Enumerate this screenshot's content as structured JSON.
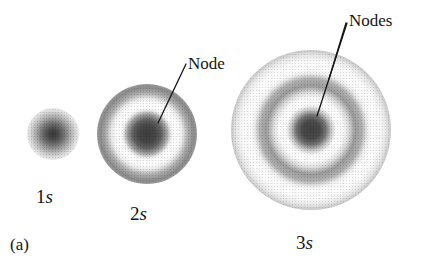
{
  "figure": {
    "panel_label": "(a)",
    "background_color": "#ffffff",
    "ink_color": "#141414",
    "width": 421,
    "height": 264
  },
  "orbitals": [
    {
      "id": "1s",
      "label_number": "1",
      "label_symbol": "s",
      "center_x": 53,
      "center_y": 134,
      "radius": 26,
      "node_count": 0,
      "label_x": 36,
      "label_y": 187
    },
    {
      "id": "2s",
      "label_number": "2",
      "label_symbol": "s",
      "center_x": 147,
      "center_y": 134,
      "radius": 50,
      "node_count": 1,
      "label_x": 130,
      "label_y": 204
    },
    {
      "id": "3s",
      "label_number": "3",
      "label_symbol": "s",
      "center_x": 311,
      "center_y": 130,
      "radius": 80,
      "node_count": 2,
      "label_x": 296,
      "label_y": 233
    }
  ],
  "callouts": [
    {
      "id": "node-2s",
      "text": "Node",
      "text_x": 188,
      "text_y": 55,
      "line_start_x": 186,
      "line_start_y": 64,
      "line_end_x": 158,
      "line_end_y": 123
    },
    {
      "id": "nodes-3s",
      "text": "Nodes",
      "text_x": 349,
      "text_y": 12,
      "lines": [
        {
          "start_x": 347,
          "start_y": 23,
          "end_x": 317,
          "end_y": 116
        },
        {
          "start_x": 346,
          "start_y": 23,
          "end_x": 329,
          "end_y": 79
        }
      ]
    }
  ]
}
